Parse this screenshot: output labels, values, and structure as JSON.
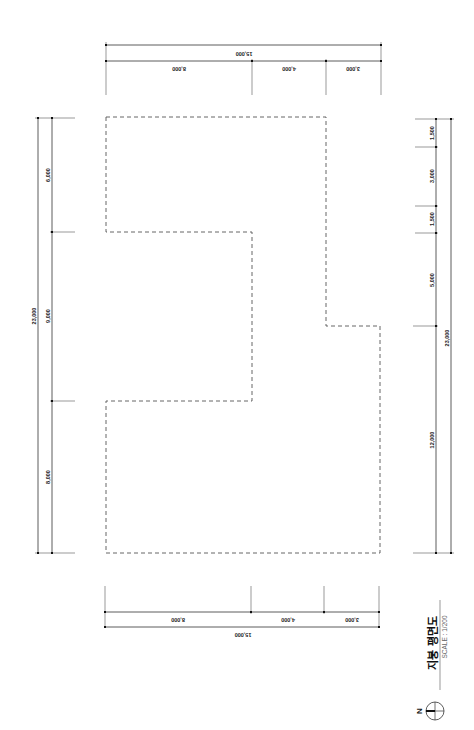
{
  "drawing": {
    "title": "지붕 평면도",
    "scale": "SCALE : 1/200",
    "north_label": "N"
  },
  "dimensions": {
    "top": {
      "total": "15,000",
      "segments": [
        "8,000",
        "4,000",
        "3,000"
      ]
    },
    "bottom": {
      "total": "15,000",
      "segments": [
        "8,000",
        "4,000",
        "3,000"
      ]
    },
    "left": {
      "total": "23,000",
      "segments": [
        "6,000",
        "9,000",
        "8,000"
      ]
    },
    "right": {
      "total": "23,000",
      "segments": [
        "1,500",
        "3,000",
        "1,500",
        "5,000",
        "12,000"
      ]
    }
  },
  "colors": {
    "line": "#333333",
    "outline": "#555555",
    "background": "#ffffff"
  }
}
